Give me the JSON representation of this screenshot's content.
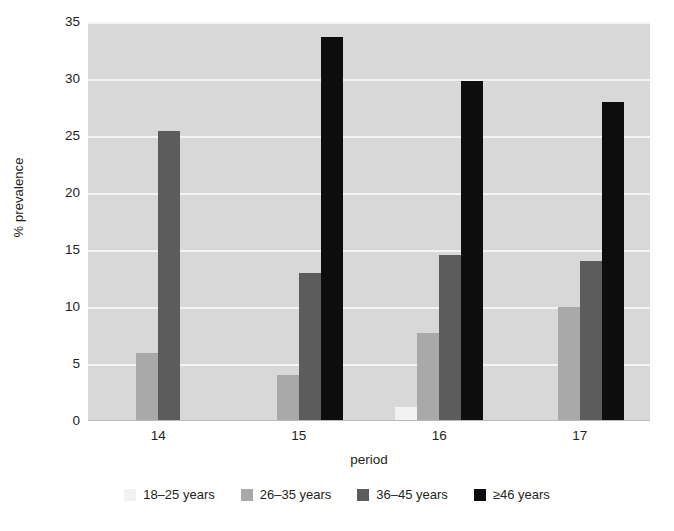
{
  "chart_data": {
    "type": "bar",
    "title": "",
    "subtitle": "",
    "xlabel": "period",
    "ylabel": "% prevalence",
    "categories": [
      "14",
      "15",
      "16",
      "17"
    ],
    "ylim": [
      0,
      35
    ],
    "yticks": [
      0,
      5,
      10,
      15,
      20,
      25,
      30,
      35
    ],
    "ytick_labels": [
      "0",
      "5",
      "10",
      "15",
      "20",
      "25",
      "30",
      "35"
    ],
    "grid": "horizontal",
    "legend_position": "bottom",
    "series": [
      {
        "name": "18–25 years",
        "color": "#f2f2f2",
        "values": [
          0,
          0,
          1.2,
          0
        ]
      },
      {
        "name": "26–35 years",
        "color": "#a9a9a9",
        "values": [
          6.0,
          4.0,
          7.7,
          10.0
        ]
      },
      {
        "name": "36–45 years",
        "color": "#5c5c5c",
        "values": [
          25.4,
          13.0,
          14.6,
          14.0
        ]
      },
      {
        "name": "≥46 years",
        "color": "#0d0d0d",
        "values": [
          0,
          33.7,
          29.8,
          28.0
        ]
      }
    ],
    "plot_background": "#d8d8d8",
    "gridline_color": "#f4f4f4",
    "text_color": "#231f20"
  }
}
